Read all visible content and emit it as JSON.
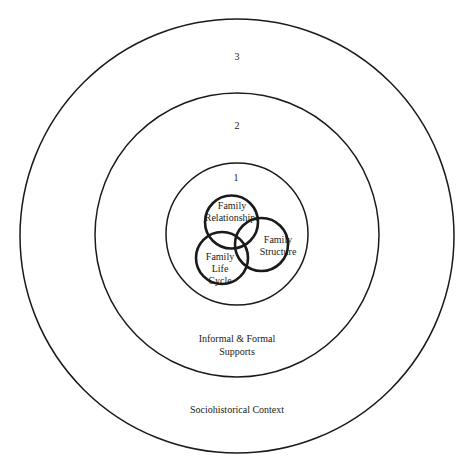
{
  "diagram": {
    "type": "nested-circles-with-venn",
    "rings": [
      {
        "level": "3",
        "label": "Sociohistorical Context",
        "cx": 237,
        "cy": 236,
        "r": 217
      },
      {
        "level": "2",
        "label_line1": "Informal & Formal",
        "label_line2": "Supports",
        "cx": 237,
        "cy": 235,
        "r": 142
      },
      {
        "level": "1",
        "cx": 237,
        "cy": 234,
        "r": 71
      }
    ],
    "venn": [
      {
        "label_line1": "Family",
        "label_line2": "Relationships",
        "cx": 231.5,
        "cy": 222,
        "r": 26.5
      },
      {
        "label_line1": "Family",
        "label_line2": "Structure",
        "cx": 261.5,
        "cy": 244.5,
        "r": 26.5
      },
      {
        "label_line1": "Family",
        "label_line2": "Life",
        "label_line3": "Cycle",
        "cx": 222,
        "cy": 258,
        "r": 26
      }
    ],
    "colors": {
      "stroke": "#1a1a1a",
      "background": "#ffffff"
    }
  }
}
